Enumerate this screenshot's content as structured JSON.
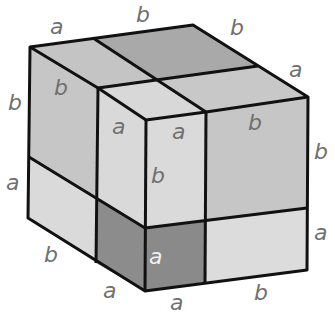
{
  "figure": {
    "colors": {
      "light": "#dcdcdc",
      "medium": "#c8c8c8",
      "top_dark": "#a9a9a9",
      "cube_a": "#8c8c8c",
      "edge": "#111111",
      "label": "#707070"
    },
    "labels": {
      "top_back_left_a": "a",
      "top_back_b": "b",
      "top_right_b": "b",
      "top_right_a": "a",
      "left_b_outer": "b",
      "left_b_inner": "b",
      "left_a_outer": "a",
      "front_a_inner": "a",
      "front_a_top": "a",
      "right_face_b": "b",
      "right_b_outer": "b",
      "front_b_mid": "b",
      "right_a_outer": "a",
      "bottom_left_b": "b",
      "small_cube_a": "a",
      "bottom_a_left": "a",
      "bottom_a_mid": "a",
      "bottom_b_right": "b"
    }
  }
}
